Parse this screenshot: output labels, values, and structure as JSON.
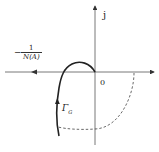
{
  "diagram": {
    "type": "nyquist-describing-function",
    "axes": {
      "imag_label": "j",
      "origin_label": "0"
    },
    "labels": {
      "neg_inverse_describing_function": {
        "sign": "−",
        "numerator": "1",
        "denominator": "N(A)"
      },
      "nyquist_curve": "Γ",
      "nyquist_curve_subscript": "G"
    },
    "colors": {
      "line": "#333333",
      "background": "#ffffff"
    }
  }
}
